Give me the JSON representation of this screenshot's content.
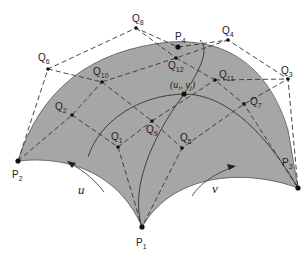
{
  "diagram": {
    "type": "bezier-triangle-patch",
    "colors": {
      "surface_fill": "#a6a6a6",
      "lines": "#333333",
      "background": "#ffffff"
    },
    "corner_points": [
      {
        "id": "P1",
        "base": "P",
        "sub": "1"
      },
      {
        "id": "P2",
        "base": "P",
        "sub": "2"
      },
      {
        "id": "P3",
        "base": "P",
        "sub": "3"
      },
      {
        "id": "P4",
        "base": "P",
        "sub": "4"
      }
    ],
    "control_points": [
      {
        "id": "Q1",
        "base": "Q",
        "sub": "1"
      },
      {
        "id": "Q2",
        "base": "Q",
        "sub": "2"
      },
      {
        "id": "Q3",
        "base": "Q",
        "sub": "3"
      },
      {
        "id": "Q4",
        "base": "Q",
        "sub": "4"
      },
      {
        "id": "Q5",
        "base": "Q",
        "sub": "5"
      },
      {
        "id": "Q6",
        "base": "Q",
        "sub": "6"
      },
      {
        "id": "Q7",
        "base": "Q",
        "sub": "7"
      },
      {
        "id": "Q8",
        "base": "Q",
        "sub": "8"
      },
      {
        "id": "Q9",
        "base": "Q",
        "sub": "9"
      },
      {
        "id": "Q10",
        "base": "Q",
        "sub": "10"
      },
      {
        "id": "Q11",
        "base": "Q",
        "sub": "11"
      },
      {
        "id": "Q12",
        "base": "Q",
        "sub": "12"
      }
    ],
    "parameter_point": {
      "open": "(",
      "u": "u",
      "u_sub": "i",
      "comma": ", ",
      "v": "v",
      "v_sub": "j",
      "close": ")"
    },
    "arrows": [
      {
        "id": "u-arrow",
        "label": "u"
      },
      {
        "id": "v-arrow",
        "label": "v"
      }
    ]
  }
}
